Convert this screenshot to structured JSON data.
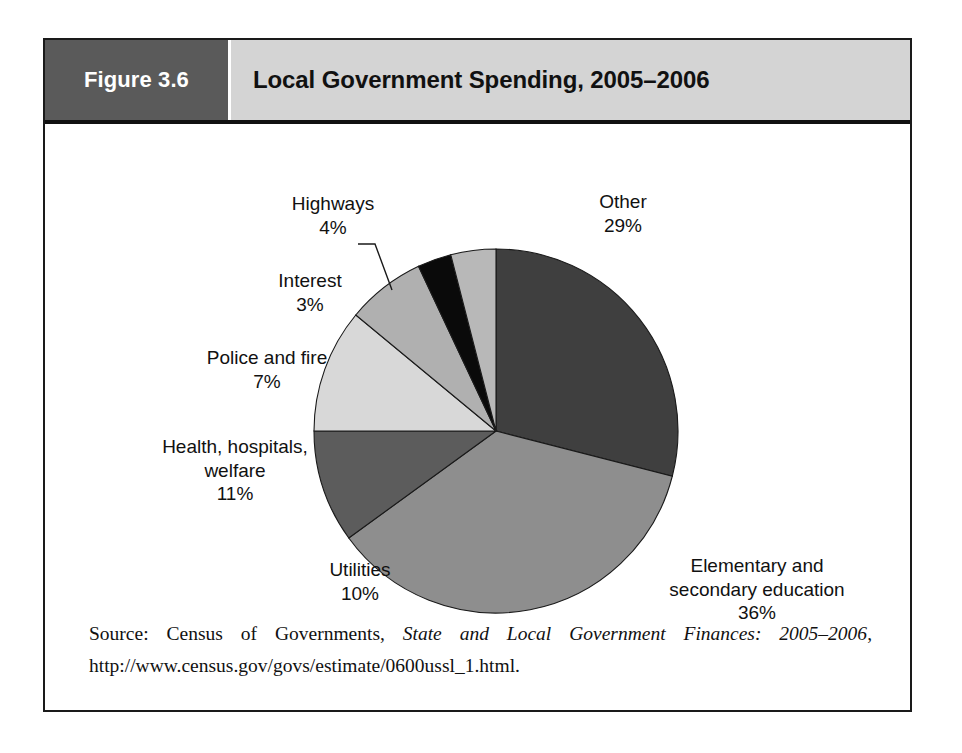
{
  "figure": {
    "number_label": "Figure 3.6",
    "title": "Local Government Spending, 2005–2006",
    "source_prefix": "Source: Census of Governments, ",
    "source_italic": "State and Local Government Finances: 2005–2006",
    "source_suffix": ", http://www.census.gov/govs/estimate/0600ussl_1.html."
  },
  "colors": {
    "header_number_bg": "#5a5a5a",
    "header_title_bg": "#d4d4d4",
    "frame_border": "#1a1a1a",
    "slice_other": "#3f3f3f",
    "slice_education": "#8e8e8e",
    "slice_utilities": "#5c5c5c",
    "slice_health": "#d8d8d8",
    "slice_police": "#b0b0b0",
    "slice_interest": "#0a0a0a",
    "slice_highways": "#b8b8b8"
  },
  "chart_data": {
    "type": "pie",
    "title": "Local Government Spending, 2005–2006",
    "legend": "none",
    "start_angle_deg": 0,
    "direction": "clockwise",
    "categories": [
      "Other",
      "Elementary and secondary education",
      "Utilities",
      "Health, hospitals, welfare",
      "Police and fire",
      "Interest",
      "Highways"
    ],
    "values": [
      29,
      36,
      10,
      11,
      7,
      3,
      4
    ],
    "unit": "percent",
    "slices": [
      {
        "name": "Other",
        "value": 29,
        "value_text": "29%",
        "color": "#3f3f3f",
        "label_lines": [
          "Other",
          "29%"
        ],
        "label_align": "center",
        "label_x": 578,
        "label_y": 66,
        "leader": false
      },
      {
        "name": "Elementary and secondary education",
        "value": 36,
        "value_text": "36%",
        "color": "#8e8e8e",
        "label_lines": [
          "Elementary and",
          "secondary education",
          "36%"
        ],
        "label_align": "center",
        "label_x": 712,
        "label_y": 430,
        "leader": false
      },
      {
        "name": "Utilities",
        "value": 10,
        "value_text": "10%",
        "color": "#5c5c5c",
        "label_lines": [
          "Utilities",
          "10%"
        ],
        "label_align": "center",
        "label_x": 315,
        "label_y": 434,
        "leader": false
      },
      {
        "name": "Health, hospitals, welfare",
        "value": 11,
        "value_text": "11%",
        "color": "#d8d8d8",
        "label_lines": [
          "Health, hospitals,",
          "welfare",
          "11%"
        ],
        "label_align": "center",
        "label_x": 190,
        "label_y": 311,
        "leader": false
      },
      {
        "name": "Police and fire",
        "value": 7,
        "value_text": "7%",
        "color": "#b0b0b0",
        "label_lines": [
          "Police and fire",
          "7%"
        ],
        "label_align": "center",
        "label_x": 222,
        "label_y": 222,
        "leader": false
      },
      {
        "name": "Interest",
        "value": 3,
        "value_text": "3%",
        "color": "#0a0a0a",
        "label_lines": [
          "Interest",
          "3%"
        ],
        "label_align": "center",
        "label_x": 265,
        "label_y": 145,
        "leader": false
      },
      {
        "name": "Highways",
        "value": 4,
        "value_text": "4%",
        "color": "#b8b8b8",
        "label_lines": [
          "Highways",
          "4%"
        ],
        "label_align": "center",
        "label_x": 288,
        "label_y": 68,
        "leader": true
      }
    ]
  }
}
